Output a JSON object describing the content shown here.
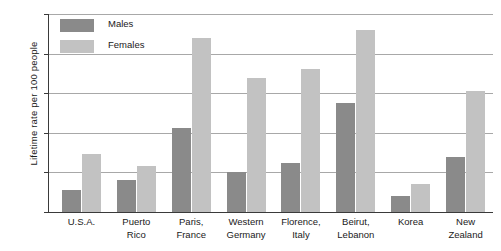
{
  "chart_data": {
    "type": "bar",
    "title": "",
    "xlabel": "",
    "ylabel": "Lifetime rate per 100 people",
    "ylim": [
      0,
      25
    ],
    "yticks": [
      0,
      5,
      10,
      15,
      20,
      25
    ],
    "grid": true,
    "legend_position": "top-left",
    "categories": [
      "U.S.A.",
      "Puerto\nRico",
      "Paris,\nFrance",
      "Western\nGermany",
      "Florence,\nItaly",
      "Beirut,\nLebanon",
      "Korea",
      "New\nZealand"
    ],
    "series": [
      {
        "name": "Males",
        "color": "#8a8a8a",
        "values": [
          2.8,
          4.0,
          10.6,
          5.0,
          6.2,
          13.8,
          2.0,
          7.0
        ]
      },
      {
        "name": "Females",
        "color": "#c2c2c2",
        "values": [
          7.3,
          5.8,
          22.0,
          16.9,
          18.0,
          23.0,
          3.5,
          15.3
        ]
      }
    ]
  },
  "legend": {
    "items": [
      {
        "label": "Males",
        "swatch": "males"
      },
      {
        "label": "Females",
        "swatch": "females"
      }
    ]
  }
}
